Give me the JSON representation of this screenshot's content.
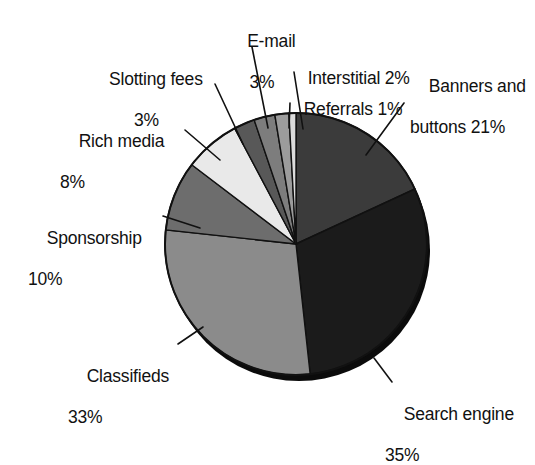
{
  "figure": {
    "background_color": "#ffffff",
    "text_color": "#111111",
    "partial_caption": ""
  },
  "chart_data": {
    "type": "pie",
    "title": "",
    "subtitle": "",
    "xlabel": "",
    "ylabel": "",
    "legend_position": "callout-labels",
    "grid": false,
    "units": "percent",
    "start_angle_deg": 0,
    "direction": "clockwise",
    "has_drop_shadow": true,
    "labels": [
      "Banners and buttons",
      "Search engine",
      "Classifieds",
      "Sponsorship",
      "Rich media",
      "Slotting fees",
      "E-mail",
      "Interstitial",
      "Referrals"
    ],
    "values": [
      21,
      35,
      33,
      10,
      8,
      3,
      3,
      2,
      1
    ],
    "value_labels": [
      "21%",
      "35%",
      "33%",
      "10%",
      "8%",
      "3%",
      "3%",
      "2%",
      "1%"
    ],
    "colors": [
      "#3b3b3b",
      "#1b1b1b",
      "#8b8b8b",
      "#6d6d6d",
      "#e9e9e9",
      "#585858",
      "#7d7d7d",
      "#9c9c9c",
      "#dcdcdc"
    ],
    "slices": [
      {
        "name": "Banners and buttons",
        "label": "Banners and",
        "label_line2": "buttons 21%",
        "value": 21,
        "value_label": "21%",
        "color": "#3b3b3b"
      },
      {
        "name": "Search engine",
        "label": "Search engine",
        "label_line2": "35%",
        "value": 35,
        "value_label": "35%",
        "color": "#1b1b1b"
      },
      {
        "name": "Classifieds",
        "label": "Classifieds",
        "label_line2": "33%",
        "value": 33,
        "value_label": "33%",
        "color": "#8b8b8b"
      },
      {
        "name": "Sponsorship",
        "label": "Sponsorship",
        "label_line2": "10%",
        "value": 10,
        "value_label": "10%",
        "color": "#6d6d6d"
      },
      {
        "name": "Rich media",
        "label": "Rich media",
        "label_line2": "8%",
        "value": 8,
        "value_label": "8%",
        "color": "#e9e9e9"
      },
      {
        "name": "Slotting fees",
        "label": "Slotting fees",
        "label_line2": "3%",
        "value": 3,
        "value_label": "3%",
        "color": "#585858"
      },
      {
        "name": "E-mail",
        "label": "E-mail",
        "label_line2": "3%",
        "value": 3,
        "value_label": "3%",
        "color": "#7d7d7d"
      },
      {
        "name": "Interstitial",
        "label": "Interstitial 2%",
        "label_line2": "",
        "value": 2,
        "value_label": "2%",
        "color": "#9c9c9c"
      },
      {
        "name": "Referrals",
        "label": "Referrals 1%",
        "label_line2": "",
        "value": 1,
        "value_label": "1%",
        "color": "#dcdcdc"
      }
    ]
  },
  "callouts": {
    "email": {
      "line1": "E-mail",
      "line2": "3%"
    },
    "slotting": {
      "line1": "Slotting fees",
      "line2": "3%"
    },
    "rich_media": {
      "line1": "Rich media",
      "line2": "8%"
    },
    "sponsorship": {
      "line1": "Sponsorship",
      "line2": "10%"
    },
    "classifieds": {
      "line1": "Classifieds",
      "line2": "33%"
    },
    "interstitial": {
      "line1": "Interstitial 2%",
      "line2": ""
    },
    "referrals": {
      "line1": "Referrals 1%",
      "line2": ""
    },
    "banners": {
      "line1": "Banners and",
      "line2": "buttons 21%"
    },
    "search": {
      "line1": "Search engine",
      "line2": "35%"
    }
  }
}
